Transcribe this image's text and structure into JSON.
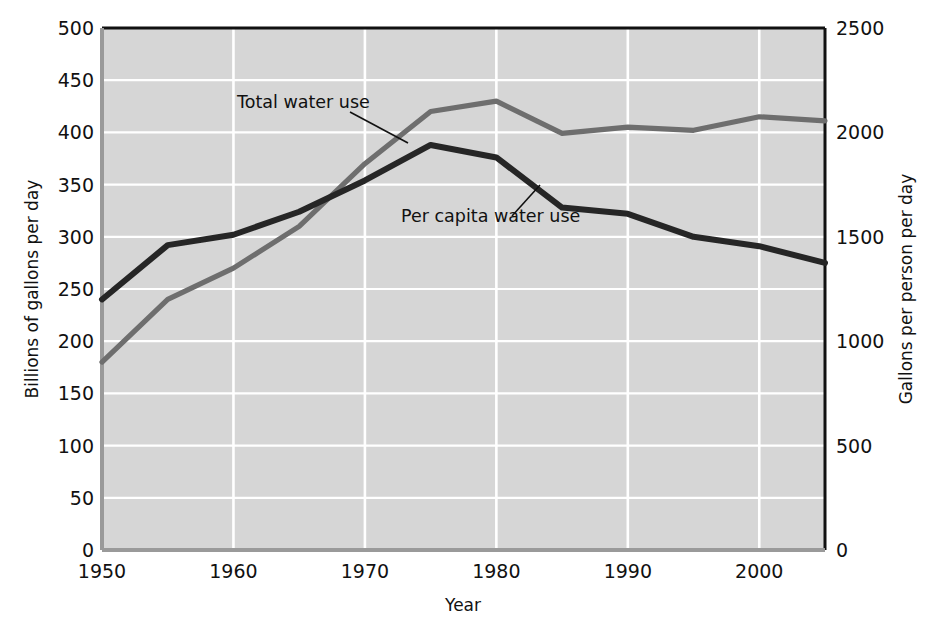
{
  "chart_data": {
    "type": "line",
    "title": "",
    "xlabel": "Year",
    "ylabel": "Billions of gallons per day",
    "ylabel_right": "Gallons per person per day",
    "x": [
      1950,
      1955,
      1960,
      1965,
      1970,
      1975,
      1980,
      1985,
      1990,
      1995,
      2000,
      2005
    ],
    "xlim": [
      1950,
      2005
    ],
    "ylim": [
      0,
      500
    ],
    "ylim_right": [
      0,
      2500
    ],
    "xticks": [
      1950,
      1960,
      1970,
      1980,
      1990,
      2000
    ],
    "xtick_labels": [
      "1950",
      "1960",
      "1970",
      "1980",
      "1990",
      "2000"
    ],
    "yticks": [
      0,
      50,
      100,
      150,
      200,
      250,
      300,
      350,
      400,
      450,
      500
    ],
    "ytick_labels": [
      "0",
      "50",
      "100",
      "150",
      "200",
      "250",
      "300",
      "350",
      "400",
      "450",
      "500"
    ],
    "yticks_right": [
      0,
      500,
      1000,
      1500,
      2000,
      2500
    ],
    "ytick_labels_right": [
      "0",
      "500",
      "1000",
      "1500",
      "2000",
      "2500"
    ],
    "grid": true,
    "grid_color": "#ffffff",
    "plot_background": "#d6d6d6",
    "legend_position": "inline-annotations",
    "series": [
      {
        "name": "Total water use",
        "axis": "left",
        "color": "#6e6e6e",
        "values": [
          180,
          240,
          270,
          310,
          370,
          420,
          430,
          399,
          405,
          402,
          415,
          411
        ]
      },
      {
        "name": "Per capita water use",
        "axis": "right",
        "color": "#262626",
        "values": [
          1200,
          1460,
          1510,
          1620,
          1770,
          1940,
          1880,
          1640,
          1610,
          1500,
          1455,
          1375
        ]
      }
    ],
    "annotations": [
      {
        "text": "Total water use",
        "target_series": "Total water use",
        "text_x": 237,
        "text_y": 108,
        "leader_from_x": 350,
        "leader_from_y": 112,
        "leader_to_x": 408,
        "leader_to_y": 143
      },
      {
        "text": "Per capita water use",
        "target_series": "Per capita water use",
        "text_x": 401,
        "text_y": 222,
        "leader_from_x": 512,
        "leader_from_y": 216,
        "leader_to_x": 540,
        "leader_to_y": 185
      }
    ]
  }
}
